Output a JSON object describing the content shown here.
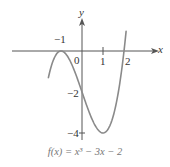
{
  "chart_data": {
    "type": "line",
    "title": "",
    "caption": "f(x) = x³ − 3x − 2",
    "xlabel": "x",
    "ylabel": "y",
    "x_ticks": [
      -1,
      0,
      1,
      2
    ],
    "y_ticks": [
      -2,
      -4
    ],
    "x_tick_labels": [
      "−1",
      "0",
      "1",
      "2"
    ],
    "y_tick_labels": [
      "−2",
      "−4"
    ],
    "series": [
      {
        "name": "f(x) = x^3 - 3x - 2",
        "function": "x^3 - 3x - 2",
        "x": [
          -1.6,
          -1.5,
          -1.25,
          -1.0,
          -0.75,
          -0.5,
          -0.25,
          0,
          0.25,
          0.5,
          0.75,
          1.0,
          1.25,
          1.5,
          1.75,
          2.0,
          2.1
        ],
        "y": [
          -1.3,
          -0.88,
          -0.2,
          0.0,
          -0.17,
          -0.63,
          -1.27,
          -2.0,
          -2.73,
          -3.38,
          -3.83,
          -4.0,
          -3.8,
          -3.13,
          -1.89,
          0.0,
          0.96
        ]
      }
    ],
    "key_points": [
      {
        "x": -1,
        "y": 0,
        "note": "double root / local max"
      },
      {
        "x": 0,
        "y": -2,
        "note": "y-intercept"
      },
      {
        "x": 1,
        "y": -4,
        "note": "local min"
      },
      {
        "x": 2,
        "y": 0,
        "note": "root"
      }
    ],
    "xlim": [
      -1.9,
      2.4
    ],
    "ylim": [
      -4.4,
      1.6
    ],
    "grid": false,
    "legend": null,
    "colors": {
      "curve": "#8a8a8a",
      "axis": "#555555"
    }
  }
}
